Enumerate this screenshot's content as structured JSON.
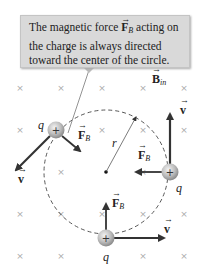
{
  "callout": {
    "lines": [
      "The magnetic force ",
      " acting on",
      "the charge is always directed",
      "toward the center of the circle."
    ],
    "force_symbol": "F",
    "force_subscript": "B"
  },
  "field": {
    "symbol": "B",
    "subscript": "in",
    "marker": "×",
    "grid_x": [
      20,
      61,
      102,
      143,
      184
    ],
    "grid_y": [
      88,
      130,
      172,
      214,
      256
    ]
  },
  "circle": {
    "cx": 106,
    "cy": 172,
    "r": 62,
    "radius_label": "r"
  },
  "charges": [
    {
      "id": "left",
      "x": 56,
      "y": 130,
      "label": "q",
      "sign": "+",
      "v": [
        14,
        172
      ],
      "F": [
        82,
        152
      ]
    },
    {
      "id": "right",
      "x": 170,
      "y": 172,
      "label": "q",
      "sign": "+",
      "v": [
        170,
        112
      ],
      "F": [
        134,
        172
      ]
    },
    {
      "id": "bottom",
      "x": 106,
      "y": 238,
      "label": "q",
      "sign": "+",
      "v": [
        166,
        238
      ],
      "F": [
        106,
        202
      ]
    }
  ],
  "labels": {
    "velocity": "v",
    "force": "F",
    "force_subscript": "B",
    "charge": "q"
  },
  "colors": {
    "callout_bg": "#d9d9d9",
    "arrow": "#333333",
    "marker": "#aaaaaa",
    "charge": "#b8b8b8"
  }
}
